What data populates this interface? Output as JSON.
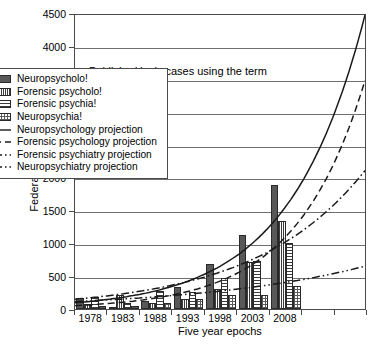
{
  "chart_data": {
    "type": "bar",
    "title": "Published lexis cases using the term",
    "xlabel": "Five year epochs",
    "ylabel": "Federal and state cases",
    "ylim": [
      0,
      4500
    ],
    "ytick_step": 500,
    "yticks": [
      "0",
      "500",
      "1000",
      "1500",
      "2000",
      "2500",
      "3000",
      "3500",
      "4000",
      "4500"
    ],
    "categories": [
      "1978",
      "1983",
      "1988",
      "1993",
      "1998",
      "2003",
      "2008"
    ],
    "grid": true,
    "legend_position": "upper-left-inside",
    "series": [
      {
        "name": "Neuropsycholo!",
        "kind": "bar",
        "pattern": "solid",
        "values": [
          160,
          30,
          120,
          330,
          680,
          1120,
          1890
        ]
      },
      {
        "name": "Forensic psycholo!",
        "kind": "bar",
        "pattern": "vertical",
        "values": [
          70,
          215,
          95,
          150,
          310,
          720,
          1345
        ]
      },
      {
        "name": "Forensic psychia!",
        "kind": "bar",
        "pattern": "horizontal",
        "values": [
          185,
          95,
          275,
          260,
          465,
          730,
          1010
        ]
      },
      {
        "name": "Neuropsychia!",
        "kind": "bar",
        "pattern": "grid",
        "values": [
          40,
          50,
          85,
          150,
          215,
          220,
          355
        ]
      },
      {
        "name": "Neuropsychology projection",
        "kind": "line",
        "dash": "solid",
        "endpoint": 4500
      },
      {
        "name": "Forensic psychology projection",
        "kind": "line",
        "dash": "dashed",
        "endpoint": 3500
      },
      {
        "name": "Forensic psychiatry projection",
        "kind": "line",
        "dash": "dash-dot",
        "endpoint": 2120
      },
      {
        "name": "Neuropsychiatry projection",
        "kind": "line",
        "dash": "dash-dot-dot",
        "endpoint": 655
      }
    ]
  },
  "legend": {
    "entries": [
      "Neuropsycholo!",
      "Forensic psycholo!",
      "Forensic psychia!",
      "Neuropsychia!",
      "Neuropsychology projection",
      "Forensic psychology projection",
      "Forensic psychiatry projection",
      "Neuropsychiatry projection"
    ]
  },
  "colors": {
    "axis": "#4a4a4a",
    "grid": "#6f6f6f",
    "bar_solid": "#585858",
    "ink": "#000000",
    "background": "#ffffff"
  }
}
